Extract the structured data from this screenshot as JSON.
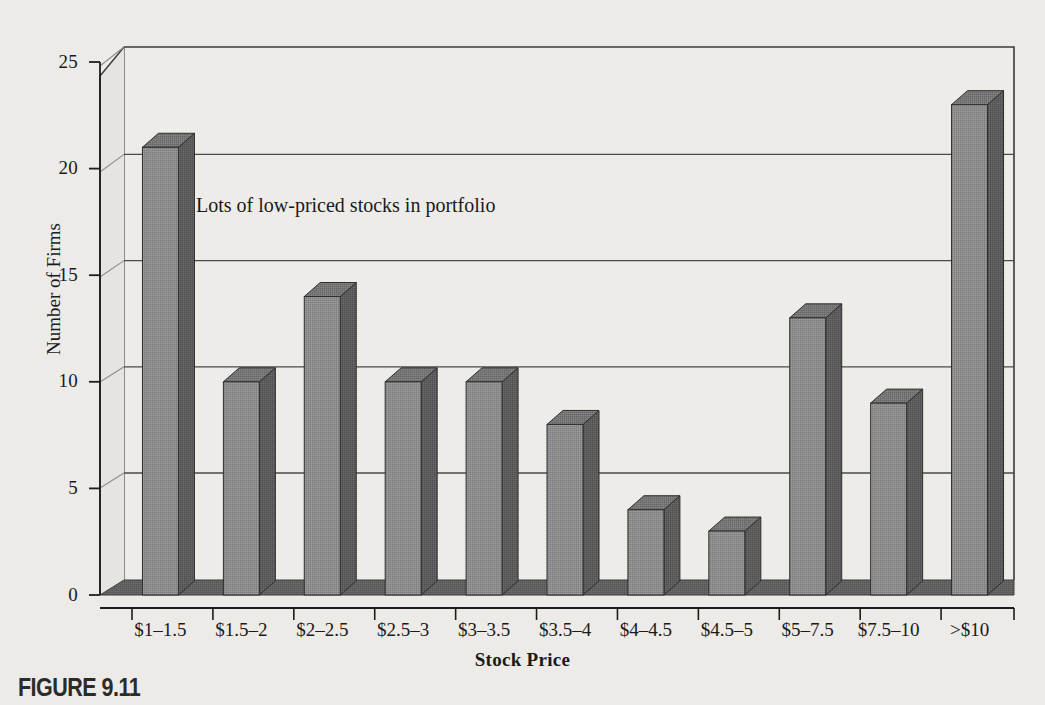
{
  "figure": {
    "caption": "FIGURE 9.11"
  },
  "annotation": {
    "text": "Lots of low-priced stocks in portfolio"
  },
  "colors": {
    "background": "#edebe7",
    "plot_background": "#eeece9",
    "bar_front": "#8e8e8e",
    "bar_side": "#5c5c5c",
    "bar_top": "#757575",
    "floor": "#616161",
    "wall_line": "#3a3a3a",
    "grid_line": "#4a4a4a",
    "text": "#1a1a1a"
  },
  "chart_data": {
    "type": "bar",
    "title": "",
    "xlabel": "Stock Price",
    "ylabel": "Number of Firms",
    "categories": [
      "$1–1.5",
      "$1.5–2",
      "$2–2.5",
      "$2.5–3",
      "$3–3.5",
      "$3.5–4",
      "$4–4.5",
      "$4.5–5",
      "$5–7.5",
      "$7.5–10",
      ">$10"
    ],
    "values": [
      21,
      10,
      14,
      10,
      10,
      8,
      4,
      3,
      13,
      9,
      23
    ],
    "ylim": [
      0,
      25
    ],
    "yticks": [
      0,
      5,
      10,
      15,
      20,
      25
    ],
    "ytick_labels": [
      "0",
      "5",
      "10",
      "15",
      "20",
      "25"
    ],
    "grid": "horizontal",
    "legend": "none",
    "style": "3d-column",
    "annotations": [
      {
        "text": "Lots of low-priced stocks in portfolio",
        "x": "$1.5–2",
        "y": 17.5
      }
    ]
  }
}
